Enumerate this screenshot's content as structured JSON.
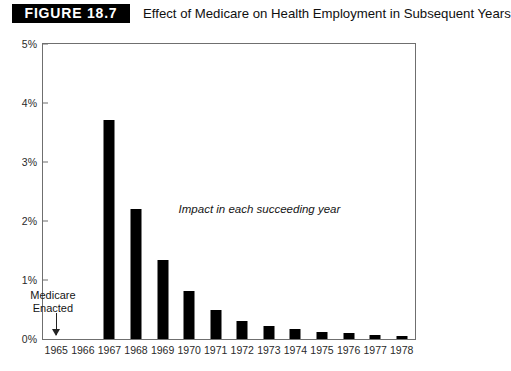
{
  "header": {
    "figure_tag": "FIGURE 18.7",
    "title": "Effect of Medicare on Health Employment in Subsequent Years"
  },
  "annotations": {
    "impact": "Impact in each succeeding year",
    "medicare_line1": "Medicare",
    "medicare_line2": "Enacted",
    "arrow_icon": "arrow-down-icon"
  },
  "colors": {
    "bar": "#000000",
    "axis": "#6f6f6f",
    "tag_background": "#000000",
    "tag_text": "#ffffff",
    "text": "#1a1a1a"
  },
  "chart_data": {
    "type": "bar",
    "title": "Effect of Medicare on Health Employment in Subsequent Years",
    "xlabel": "",
    "ylabel": "",
    "ylim": [
      0,
      5
    ],
    "yticks": [
      "0%",
      "1%",
      "2%",
      "3%",
      "4%",
      "5%"
    ],
    "ytick_values": [
      0,
      1,
      2,
      3,
      4,
      5
    ],
    "grid": false,
    "legend": "none",
    "categories": [
      "1965",
      "1966",
      "1967",
      "1968",
      "1969",
      "1970",
      "1971",
      "1972",
      "1973",
      "1974",
      "1975",
      "1976",
      "1977",
      "1978"
    ],
    "values": [
      0,
      0,
      3.72,
      2.21,
      1.34,
      0.82,
      0.5,
      0.31,
      0.22,
      0.17,
      0.12,
      0.1,
      0.07,
      0.05
    ],
    "value_unit": "percent",
    "annotations": [
      {
        "text": "Impact in each succeeding year",
        "x": "1969",
        "y": 2.3
      },
      {
        "text": "Medicare Enacted",
        "x": "1965",
        "y": 0.85
      }
    ]
  }
}
